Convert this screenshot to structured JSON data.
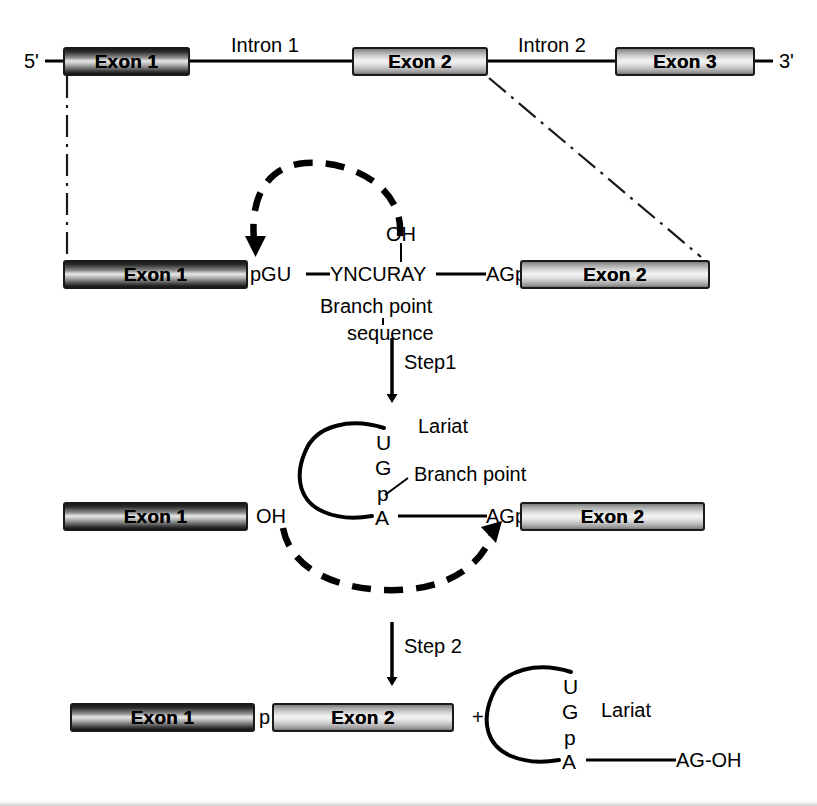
{
  "figure": {
    "colors": {
      "line": "#000000",
      "exon_dark_base": "#1c1c1c",
      "exon_light_base": "#d8d8d8",
      "background": "#ffffff"
    }
  },
  "pre_mrna": {
    "five_prime": "5'",
    "three_prime": "3'",
    "exon1": "Exon 1",
    "intron1": "Intron 1",
    "exon2": "Exon 2",
    "intron2": "Intron 2",
    "exon3": "Exon 3"
  },
  "row_intron": {
    "exon1": "Exon 1",
    "exon2": "Exon 2",
    "donor_site": "pGU",
    "branch_sequence": "YNCURAY",
    "acceptor_site": "AGp",
    "hydroxyl": "OH",
    "branch_label_line1": "Branch point",
    "branch_label_line2": "sequence"
  },
  "step1": {
    "label": "Step1"
  },
  "row_lariat": {
    "exon1": "Exon 1",
    "exon2": "Exon 2",
    "free_hydroxyl": "OH",
    "acceptor_site": "AGp",
    "lariat_label": "Lariat",
    "branch_point_label": "Branch point",
    "lariat_letters": [
      "U",
      "G",
      "p",
      "A"
    ]
  },
  "step2": {
    "label": "Step 2"
  },
  "row_products": {
    "exon1": "Exon 1",
    "exon2": "Exon 2",
    "junction_phosphate": "p",
    "plus": "+",
    "lariat_label": "Lariat",
    "lariat_letters": [
      "U",
      "G",
      "p",
      "A"
    ],
    "lariat_tail": "AG-OH"
  }
}
